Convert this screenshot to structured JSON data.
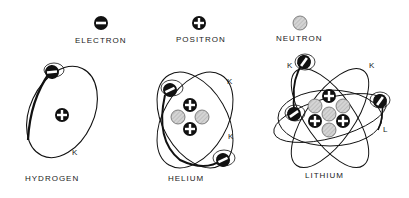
{
  "legend": {
    "electron": {
      "label": "ELECTRON",
      "icon": "electron-minus-icon"
    },
    "positron": {
      "label": "POSITRON",
      "icon": "positron-plus-icon"
    },
    "neutron": {
      "label": "NEUTRON",
      "icon": "neutron-hatched-icon"
    }
  },
  "atoms": [
    {
      "name": "HYDROGEN",
      "shells": [
        "K"
      ],
      "electrons": 1,
      "positrons": 1,
      "neutrons": 0
    },
    {
      "name": "HELIUM",
      "shells": [
        "K",
        "K"
      ],
      "electrons": 2,
      "positrons": 2,
      "neutrons": 2
    },
    {
      "name": "LITHIUM",
      "shells": [
        "K",
        "K",
        "L"
      ],
      "electrons": 3,
      "positrons": 3,
      "neutrons": 4
    }
  ],
  "colors": {
    "ink": "#111111",
    "neutron_fill": "#cfcfcf",
    "background": "#ffffff"
  }
}
